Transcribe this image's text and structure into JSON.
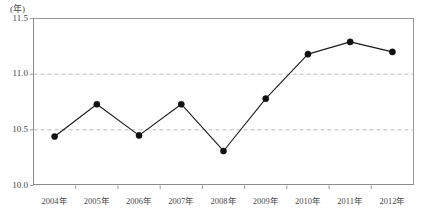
{
  "chart_data": {
    "type": "line",
    "title": "",
    "subtitle": "",
    "unit_label": "(年)",
    "xlabel": "",
    "ylabel": "",
    "categories": [
      "2004年",
      "2005年",
      "2006年",
      "2007年",
      "2008年",
      "2009年",
      "2010年",
      "2011年",
      "2012年"
    ],
    "values": [
      10.44,
      10.73,
      10.45,
      10.73,
      10.31,
      10.78,
      11.18,
      11.29,
      11.2
    ],
    "series": [
      {
        "name": "",
        "values": [
          10.44,
          10.73,
          10.45,
          10.73,
          10.31,
          10.78,
          11.18,
          11.29,
          11.2
        ]
      }
    ],
    "ylim": [
      10.0,
      11.5
    ],
    "ytick_labels": [
      "10.0",
      "10.5",
      "11.0",
      "11.5"
    ],
    "ytick_values": [
      10.0,
      10.5,
      11.0,
      11.5
    ],
    "grid": true,
    "grid_style": "dashed-horizontal",
    "gridlines_at": [
      10.5,
      11.0
    ],
    "legend": "none",
    "legend_position": "none",
    "annotations": [],
    "marker": "filled-circle",
    "line_color": "#1a1a1a",
    "marker_color": "#111111",
    "grid_color": "#b4b4b4",
    "axis_color": "#8c8c8c",
    "background_color": "#ffffff"
  }
}
